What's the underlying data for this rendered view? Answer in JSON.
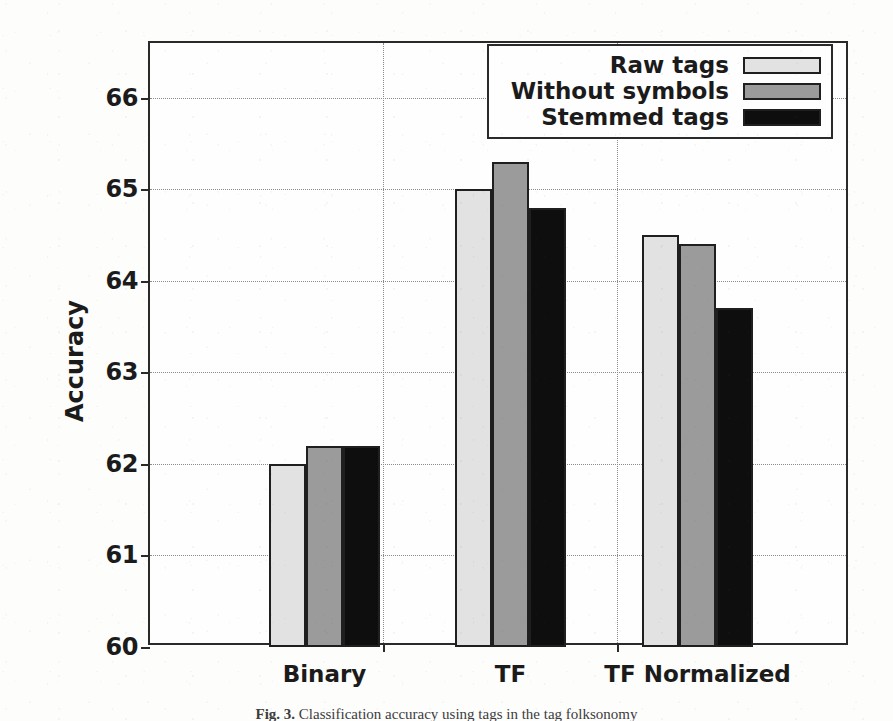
{
  "chart_data": {
    "type": "bar",
    "title": "",
    "xlabel": "",
    "ylabel": "Accuracy",
    "categories": [
      "Binary",
      "TF",
      "TF Normalized"
    ],
    "series": [
      {
        "name": "Raw tags",
        "values": [
          62.0,
          65.0,
          64.5
        ],
        "color": "#e2e2e2"
      },
      {
        "name": "Without symbols",
        "values": [
          62.2,
          65.3,
          64.4
        ],
        "color": "#9b9b9b"
      },
      {
        "name": "Stemmed tags",
        "values": [
          62.2,
          64.8,
          63.7
        ],
        "color": "#0e0e0e"
      }
    ],
    "ylim": [
      60,
      66.6
    ],
    "yticks": [
      60,
      61,
      62,
      63,
      64,
      65,
      66
    ],
    "ytick_labels": [
      "60",
      "61",
      "62",
      "63",
      "64",
      "65",
      "66"
    ],
    "grid": true,
    "grid_axis": "both",
    "legend_position": "top-right",
    "bar_edge_color": "#1f1f1f",
    "axis_color": "#2a2a2a",
    "background_color": "#fdfdfc"
  },
  "legend": {
    "entries": [
      {
        "label": "Raw tags"
      },
      {
        "label": "Without symbols"
      },
      {
        "label": "Stemmed tags"
      }
    ]
  },
  "caption": {
    "label": "Fig. 3.",
    "text": "Classification accuracy using tags in the tag folksonomy"
  }
}
